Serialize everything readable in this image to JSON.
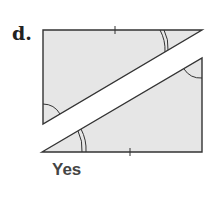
{
  "problem": {
    "label": "d.",
    "answer": "Yes"
  },
  "figure": {
    "fill_color": "#e6e6e6",
    "stroke_color": "#333333",
    "upper_triangle": {
      "points": [
        [
          43,
          30
        ],
        [
          202,
          30
        ],
        [
          43,
          124
        ]
      ]
    },
    "lower_triangle": {
      "points": [
        [
          42,
          152
        ],
        [
          202,
          58
        ],
        [
          202,
          152
        ]
      ]
    }
  }
}
